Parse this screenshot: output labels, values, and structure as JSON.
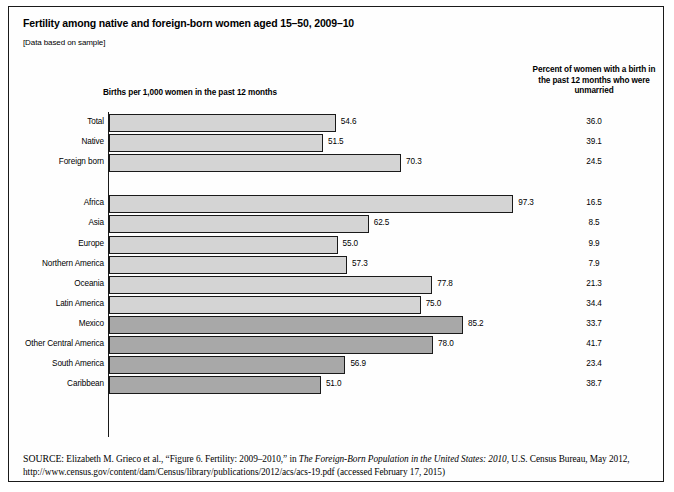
{
  "figure": {
    "title": "Fertility among native and foreign-born women aged 15–50, 2009–10",
    "subtitle": "[Data based on sample]",
    "units_label": "Births per 1,000 women in the past 12 months",
    "percent_column_header": "Percent of women with a birth in the past 12 months who were unmarried",
    "source_label": "SOURCE:",
    "source_part1": " Elizabeth M. Grieco et al., “Figure 6. Fertility: 2009–2010,” in ",
    "source_italic": "The Foreign-Born Population in the United States: 2010",
    "source_part2": ", U.S. Census Bureau, May 2012, http://www.census.gov/content/dam/Census/library/publications/2012/acs/acs-19.pdf (accessed February 17, 2015)"
  },
  "colors": {
    "bar_fill_light": "#d4d4d4",
    "bar_fill_dark": "#a8a8a8",
    "bar_stroke": "#1a1a1a",
    "axis": "#1a1a1a",
    "frame": "#1a1a1a",
    "text": "#000000"
  },
  "chart_data": {
    "type": "bar",
    "orientation": "horizontal",
    "title": "Fertility among native and foreign-born women aged 15–50, 2009–10",
    "xlabel": "Births per 1,000 women in the past 12 months",
    "ylabel": "",
    "xlim": [
      0,
      100
    ],
    "grid": false,
    "legend": "none",
    "value_label_format": "one decimal",
    "secondary_column": {
      "header": "Percent of women with a birth in the past 12 months who were unmarried",
      "name": "percent_unmarried"
    },
    "groups": [
      {
        "name": "nativity",
        "categories": [
          "Total",
          "Native",
          "Foreign born"
        ],
        "values": [
          54.6,
          51.5,
          70.3
        ],
        "percent_unmarried": [
          36.0,
          39.1,
          24.5
        ],
        "shade": [
          "light",
          "light",
          "light"
        ]
      },
      {
        "name": "region of birth",
        "categories": [
          "Africa",
          "Asia",
          "Europe",
          "Northern America",
          "Oceania",
          "Latin America",
          "Mexico",
          "Other Central America",
          "South America",
          "Caribbean"
        ],
        "values": [
          97.3,
          62.5,
          55.0,
          57.3,
          77.8,
          75.0,
          85.2,
          78.0,
          56.9,
          51.0
        ],
        "percent_unmarried": [
          16.5,
          8.5,
          9.9,
          7.9,
          21.3,
          34.4,
          33.7,
          41.7,
          23.4,
          38.7
        ],
        "shade": [
          "light",
          "light",
          "light",
          "light",
          "light",
          "light",
          "dark",
          "dark",
          "dark",
          "dark"
        ]
      }
    ],
    "rows": [
      {
        "label": "Total",
        "value": 54.6,
        "value_text": "54.6",
        "percent": 36.0,
        "percent_text": "36.0",
        "shade": "light",
        "group": 0
      },
      {
        "label": "Native",
        "value": 51.5,
        "value_text": "51.5",
        "percent": 39.1,
        "percent_text": "39.1",
        "shade": "light",
        "group": 0
      },
      {
        "label": "Foreign born",
        "value": 70.3,
        "value_text": "70.3",
        "percent": 24.5,
        "percent_text": "24.5",
        "shade": "light",
        "group": 0
      },
      {
        "label": "Africa",
        "value": 97.3,
        "value_text": "97.3",
        "percent": 16.5,
        "percent_text": "16.5",
        "shade": "light",
        "group": 1
      },
      {
        "label": "Asia",
        "value": 62.5,
        "value_text": "62.5",
        "percent": 8.5,
        "percent_text": "8.5",
        "shade": "light",
        "group": 1
      },
      {
        "label": "Europe",
        "value": 55.0,
        "value_text": "55.0",
        "percent": 9.9,
        "percent_text": "9.9",
        "shade": "light",
        "group": 1
      },
      {
        "label": "Northern America",
        "value": 57.3,
        "value_text": "57.3",
        "percent": 7.9,
        "percent_text": "7.9",
        "shade": "light",
        "group": 1
      },
      {
        "label": "Oceania",
        "value": 77.8,
        "value_text": "77.8",
        "percent": 21.3,
        "percent_text": "21.3",
        "shade": "light",
        "group": 1
      },
      {
        "label": "Latin America",
        "value": 75.0,
        "value_text": "75.0",
        "percent": 34.4,
        "percent_text": "34.4",
        "shade": "light",
        "group": 1
      },
      {
        "label": "Mexico",
        "value": 85.2,
        "value_text": "85.2",
        "percent": 33.7,
        "percent_text": "33.7",
        "shade": "dark",
        "group": 1
      },
      {
        "label": "Other Central America",
        "value": 78.0,
        "value_text": "78.0",
        "percent": 41.7,
        "percent_text": "41.7",
        "shade": "dark",
        "group": 1
      },
      {
        "label": "South America",
        "value": 56.9,
        "value_text": "56.9",
        "percent": 23.4,
        "percent_text": "23.4",
        "shade": "dark",
        "group": 1
      },
      {
        "label": "Caribbean",
        "value": 51.0,
        "value_text": "51.0",
        "percent": 38.7,
        "percent_text": "38.7",
        "shade": "dark",
        "group": 1
      }
    ]
  }
}
